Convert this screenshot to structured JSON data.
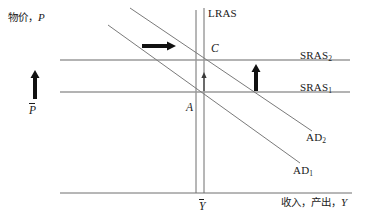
{
  "figure": {
    "type": "economics-ad-as-diagram",
    "background": "#ffffff",
    "ink": "#1a1a1a",
    "line_color": "#6e6e6e"
  },
  "axes": {
    "y_axis": {
      "label_cn": "物价",
      "label_sep": "，",
      "label_var": "P",
      "x": 196,
      "y_top": 10,
      "y_bottom": 193
    },
    "x_axis": {
      "label_cn_1": "收入",
      "label_sep": "，",
      "label_cn_2": "产出",
      "label_var": "Y",
      "y": 193,
      "x_left": 60,
      "x_right": 352
    }
  },
  "curves": [
    {
      "name": "LRAS",
      "label": "LRAS",
      "subscript": "",
      "kind": "vertical",
      "label_x": 203,
      "label_y": 8
    },
    {
      "name": "SRAS2",
      "label": "SRAS",
      "subscript": "2",
      "kind": "horizontal",
      "label_x": 299,
      "label_y": 50
    },
    {
      "name": "SRAS1",
      "label": "SRAS",
      "subscript": "1",
      "kind": "horizontal",
      "label_x": 299,
      "label_y": 82
    },
    {
      "name": "AD2",
      "label": "AD",
      "subscript": "2",
      "kind": "downward-sloping",
      "label_x": 305,
      "label_y": 132
    },
    {
      "name": "AD1",
      "label": "AD",
      "subscript": "1",
      "kind": "downward-sloping",
      "label_x": 292,
      "label_y": 164
    }
  ],
  "points": [
    {
      "name": "C",
      "label": "C",
      "x": 211,
      "y": 43
    },
    {
      "name": "A",
      "label": "A",
      "x": 188,
      "y": 103
    }
  ],
  "tick_labels": {
    "price_level": "P",
    "output_level": "Y"
  },
  "annotations": {
    "price_rise_arrow": "upward-arrow-price-level",
    "ad_shift_arrow": "rightward-arrow-ad-shift",
    "sras_shift_arrow": "upward-arrow-sras-shift",
    "equilibrium_move_arrow": "upward-arrow-a-to-c"
  }
}
